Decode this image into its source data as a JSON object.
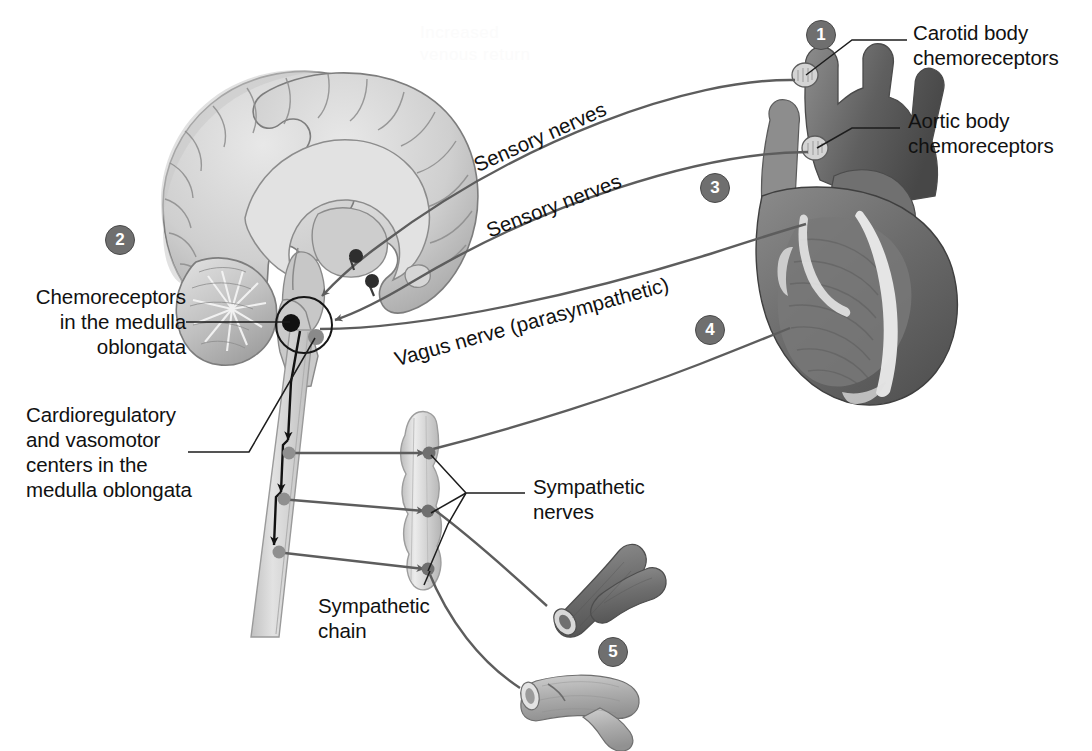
{
  "figure": {
    "background_color": "#ffffff",
    "ghost_text_top": "Increased\nvenous return"
  },
  "labels": {
    "carotid": "Carotid body\nchemoreceptors",
    "aortic": "Aortic body\nchemoreceptors",
    "medulla_chemo": "Chemoreceptors\nin the medulla\noblongata",
    "cardioregulatory": "Cardioregulatory\nand vasomotor\ncenters in the\nmedulla oblongata",
    "sensory_nerves_1": "Sensory nerves",
    "sensory_nerves_2": "Sensory nerves",
    "vagus": "Vagus nerve (parasympathetic)",
    "sympathetic_nerves": "Sympathetic\nnerves",
    "sympathetic_chain": "Sympathetic\nchain"
  },
  "callouts": [
    {
      "number": "1",
      "x": 806,
      "y": 20,
      "target": "carotid-body"
    },
    {
      "number": "2",
      "x": 105,
      "y": 225,
      "target": "medulla"
    },
    {
      "number": "3",
      "x": 700,
      "y": 173,
      "target": "heart-sensory"
    },
    {
      "number": "4",
      "x": 695,
      "y": 315,
      "target": "sympathetic-to-heart"
    },
    {
      "number": "5",
      "x": 598,
      "y": 637,
      "target": "blood-vessels"
    }
  ],
  "colors": {
    "line": "#5d5d5d",
    "text": "#111111",
    "callout_fill": "#6f6f6f",
    "callout_text": "#ffffff",
    "brain_light": "#dcdcdc",
    "brain_mid": "#b9b9b9",
    "brain_dark": "#8f8f8f",
    "heart_dark": "#6d6d6d",
    "heart_mid": "#8a8a8a",
    "heart_light": "#d8d8d8",
    "vessel_dark": "#7a7a7a",
    "vessel_light": "#b5b5b5",
    "ganglion": "#6f6f6f",
    "chain_light": "#d5d5d5"
  },
  "structures": {
    "brain": "mid-sagittal section of brain with cerebrum, corpus callosum, cerebellum and brainstem",
    "heart": "anterior view of heart with aortic arch and great vessels",
    "spinal_cord": "spinal cord descending from medulla with three outgoing tracts",
    "sympathetic_chain": "beaded sympathetic chain with three ganglia",
    "artery": "branching artery (dark)",
    "vein": "branching vein (light)"
  }
}
